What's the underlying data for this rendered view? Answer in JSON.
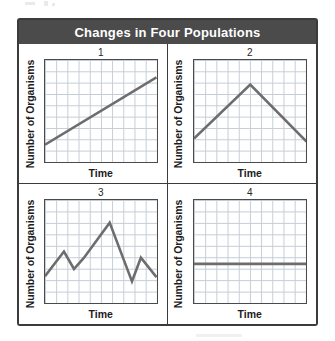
{
  "figure": {
    "title": "Changes in Four Populations",
    "accent_color": "#4b4b4b",
    "border_color": "#3b3b3b",
    "line_color": "#6d6d6d",
    "grid_color": "#b9c3cf"
  },
  "axis": {
    "y_label": "Number of Organisms",
    "x_label": "Time"
  },
  "panels": [
    {
      "number": "1"
    },
    {
      "number": "2"
    },
    {
      "number": "3"
    },
    {
      "number": "4"
    }
  ],
  "chart_data": [
    {
      "type": "line",
      "title": "1",
      "xlabel": "Time",
      "ylabel": "Number of Organisms",
      "xlim": [
        0,
        100
      ],
      "ylim": [
        0,
        100
      ],
      "grid": true,
      "legend": "none",
      "description": "Steady linear increase over time",
      "x": [
        0,
        100
      ],
      "y": [
        17,
        83
      ]
    },
    {
      "type": "line",
      "title": "2",
      "xlabel": "Time",
      "ylabel": "Number of Organisms",
      "xlim": [
        0,
        100
      ],
      "ylim": [
        0,
        100
      ],
      "grid": true,
      "legend": "none",
      "description": "Increase to a peak near the midpoint, then steady decrease",
      "x": [
        0,
        50,
        100
      ],
      "y": [
        23,
        76,
        20
      ]
    },
    {
      "type": "line",
      "title": "3",
      "xlabel": "Time",
      "ylabel": "Number of Organisms",
      "xlim": [
        0,
        100
      ],
      "ylim": [
        0,
        100
      ],
      "grid": true,
      "legend": "none",
      "description": "Repeated rises and falls with an overall peak past the midpoint",
      "x": [
        0,
        17,
        26,
        35,
        58,
        78,
        86,
        100
      ],
      "y": [
        26,
        50,
        33,
        44,
        78,
        21,
        44,
        25
      ]
    },
    {
      "type": "line",
      "title": "4",
      "xlabel": "Time",
      "ylabel": "Number of Organisms",
      "xlim": [
        0,
        100
      ],
      "ylim": [
        0,
        100
      ],
      "grid": true,
      "legend": "none",
      "description": "No change over time; population remains constant",
      "x": [
        0,
        100
      ],
      "y": [
        38,
        38
      ]
    }
  ]
}
